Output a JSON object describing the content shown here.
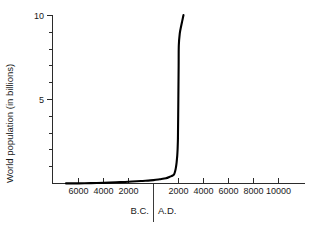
{
  "chart_data": {
    "type": "line",
    "title": "",
    "subtitle": "",
    "xlabel": "",
    "ylabel": "World population (in billions)",
    "xlim": [
      -7000,
      10000
    ],
    "ylim": [
      0,
      10
    ],
    "grid": false,
    "legend": null,
    "y_axis": {
      "label": "World population (in billions)",
      "major_ticks": [
        {
          "value": 10,
          "label": "10"
        },
        {
          "value": 5,
          "label": "5"
        }
      ],
      "minor_ticks": [
        1,
        2,
        3,
        4,
        6,
        7,
        8,
        9
      ],
      "min": 0,
      "max": 10,
      "units": "billions"
    },
    "x_axis": {
      "ticks_bc": [
        {
          "value": -6000,
          "label": "6000"
        },
        {
          "value": -4000,
          "label": "4000"
        },
        {
          "value": -2000,
          "label": "2000"
        }
      ],
      "ticks_ad": [
        {
          "value": 2000,
          "label": "2000"
        },
        {
          "value": 4000,
          "label": "4000"
        },
        {
          "value": 6000,
          "label": "6000"
        },
        {
          "value": 8000,
          "label": "8000"
        },
        {
          "value": 10000,
          "label": "10000"
        }
      ],
      "era_left_label": "B.C.",
      "era_right_label": "A.D.",
      "era_boundary_value": 0,
      "min": -7000,
      "max": 10000
    },
    "series": [
      {
        "name": "World population",
        "color": "#000000",
        "x": [
          -7000,
          -6000,
          -5000,
          -4000,
          -3000,
          -2000,
          -1000,
          0,
          500,
          1000,
          1300,
          1500,
          1650,
          1750,
          1800,
          1850,
          1900,
          1930,
          1950,
          1960,
          1975,
          1987,
          2000,
          2011,
          2025,
          2100,
          2200,
          2300,
          2400
        ],
        "y": [
          0.005,
          0.01,
          0.02,
          0.04,
          0.07,
          0.1,
          0.15,
          0.2,
          0.25,
          0.31,
          0.4,
          0.46,
          0.55,
          0.79,
          0.98,
          1.26,
          1.65,
          2.07,
          2.52,
          3.03,
          4.07,
          5.0,
          6.07,
          7.0,
          8.2,
          8.9,
          9.3,
          9.65,
          10.0
        ]
      }
    ]
  },
  "axis_labels": {
    "y_title": "World population (in billions)",
    "y_tick_10": "10",
    "y_tick_5": "5",
    "x_tick_bc_6000": "6000",
    "x_tick_bc_4000": "4000",
    "x_tick_bc_2000": "2000",
    "x_tick_ad_2000": "2000",
    "x_tick_ad_4000": "4000",
    "x_tick_ad_6000": "6000",
    "x_tick_ad_8000": "8000",
    "x_tick_ad_10000": "10000",
    "era_bc": "B.C.",
    "era_ad": "A.D."
  },
  "colors": {
    "line": "#000000",
    "axis": "#2b2b2b",
    "text": "#1a1a1a",
    "background": "#ffffff"
  }
}
